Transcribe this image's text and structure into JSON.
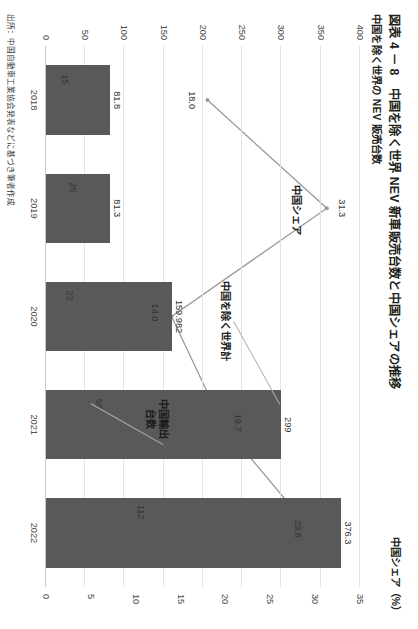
{
  "figure": {
    "title": "図表 4 － 8　中国を除く世界 NEV 新車販売台数と中国シェアの推移",
    "subtitle": "中国を除く世界の NEV 販売台数",
    "right_axis_title": "中国シェア（%）",
    "source": "出所：中国自動車工業協会発表などに基づき筆者作成"
  },
  "annotations": {
    "world_ex_china": "中国を除く世界計",
    "china_export": "中国輸出\n台数",
    "china_export_line1": "中国輸出",
    "china_export_line2": "台数",
    "china_share": "中国シェア"
  },
  "chart_data": {
    "type": "bar",
    "title": "図表 4 － 8　中国を除く世界 NEV 新車販売台数と中国シェアの推移",
    "categories": [
      "2018",
      "2019",
      "2020",
      "2021",
      "2022"
    ],
    "xlabel": "",
    "ylabel": "中国を除く世界の NEV 販売台数",
    "ylim": [
      0,
      400
    ],
    "yticks": [
      "0",
      "50",
      "100",
      "150",
      "200",
      "250",
      "300",
      "350",
      "400"
    ],
    "y2label": "中国シェア（%）",
    "y2lim": [
      0,
      35
    ],
    "y2ticks": [
      "0",
      "5",
      "10",
      "15",
      "20",
      "25",
      "30",
      "35"
    ],
    "grid": true,
    "legend": "none",
    "series": [
      {
        "name": "中国を除く世界計",
        "type": "bar",
        "axis": "left",
        "values": [
          81.8,
          81.3,
          159.982,
          299,
          376.3
        ],
        "labels": [
          "81.8",
          "81.3",
          "159.982",
          "299",
          "376.3"
        ]
      },
      {
        "name": "中国輸出台数",
        "type": "bar",
        "axis": "left",
        "values": [
          15,
          25,
          22,
          59,
          112
        ],
        "labels": [
          "15",
          "25",
          "22",
          "59",
          "112"
        ]
      },
      {
        "name": "中国シェア",
        "type": "line",
        "axis": "right",
        "values": [
          18.0,
          31.3,
          14.0,
          19.7,
          29.8
        ],
        "labels": [
          "18.0",
          "31.3",
          "14.0",
          "19.7",
          "29.8"
        ]
      }
    ]
  }
}
